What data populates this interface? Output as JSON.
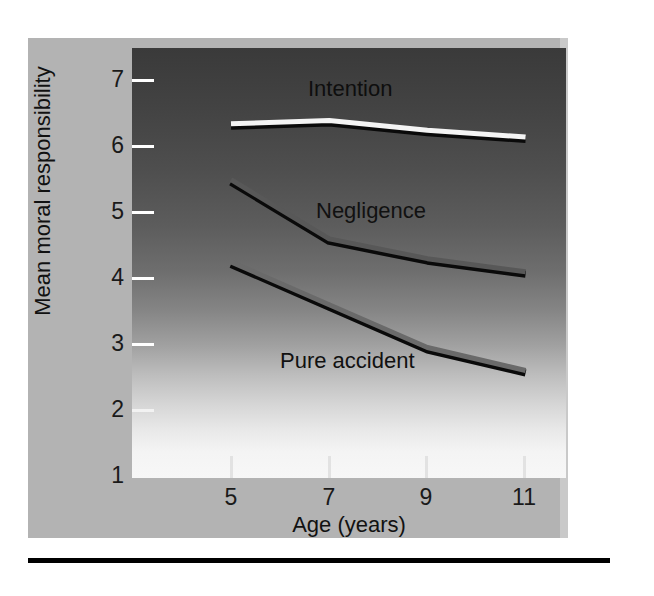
{
  "figure": {
    "background_color": "#b3b3b3",
    "plot_background": "dark-to-light vertical gradient",
    "bottom_rule_color": "#000000"
  },
  "chart_data": {
    "type": "line",
    "title": "",
    "xlabel": "Age (years)",
    "ylabel": "Mean moral responsibility",
    "x": [
      5,
      7,
      9,
      11
    ],
    "xtick_labels": [
      "5",
      "7",
      "9",
      "11"
    ],
    "ytick_labels": [
      "1",
      "2",
      "3",
      "4",
      "5",
      "6",
      "7"
    ],
    "xlim": [
      4,
      12
    ],
    "ylim": [
      1,
      7
    ],
    "grid": false,
    "legend_position": "inline-annotations",
    "series": [
      {
        "name": "Intention",
        "values": [
          6.35,
          6.4,
          6.25,
          6.15
        ],
        "color": "#f4f4f4",
        "label_x": 7.1,
        "label_y": 6.75
      },
      {
        "name": "Negligence",
        "values": [
          5.5,
          4.6,
          4.3,
          4.1
        ],
        "color": "#585858",
        "label_x": 7.2,
        "label_y": 5.05
      },
      {
        "name": "Pure accident",
        "values": [
          4.25,
          3.6,
          2.95,
          2.6
        ],
        "color": "#6a6a6a",
        "label_x": 6.6,
        "label_y": 2.72
      }
    ]
  },
  "axis": {
    "y_title": "Mean moral responsibility",
    "x_title": "Age (years)",
    "y_ticks": [
      "7",
      "6",
      "5",
      "4",
      "3",
      "2",
      "1"
    ],
    "x_ticks": [
      "5",
      "7",
      "9",
      "11"
    ]
  }
}
